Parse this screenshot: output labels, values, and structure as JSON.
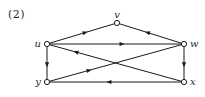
{
  "figure": {
    "label": "(2)",
    "caption": "",
    "type": "directed-graph"
  },
  "graph_data": {
    "type": "diagram",
    "directed": true,
    "nodes": [
      {
        "id": "v",
        "label": "v",
        "x": 117,
        "y": 23,
        "label_dx": 0,
        "label_dy": -5,
        "label_anchor": "middle"
      },
      {
        "id": "u",
        "label": "u",
        "x": 47,
        "y": 44,
        "label_dx": -6,
        "label_dy": 3,
        "label_anchor": "end"
      },
      {
        "id": "w",
        "label": "w",
        "x": 184,
        "y": 44,
        "label_dx": 6,
        "label_dy": 3,
        "label_anchor": "start"
      },
      {
        "id": "y",
        "label": "y",
        "x": 47,
        "y": 82,
        "label_dx": -6,
        "label_dy": 3,
        "label_anchor": "end"
      },
      {
        "id": "x",
        "label": "x",
        "x": 184,
        "y": 82,
        "label_dx": 6,
        "label_dy": 3,
        "label_anchor": "start"
      }
    ],
    "edges": [
      {
        "id": "u-v",
        "from": "u",
        "to": "v",
        "arrow_t": 0.55
      },
      {
        "id": "w-v",
        "from": "w",
        "to": "v",
        "arrow_t": 0.55
      },
      {
        "id": "u-w",
        "from": "u",
        "to": "w",
        "arrow_t": 0.55
      },
      {
        "id": "u-y",
        "from": "u",
        "to": "y",
        "arrow_t": 0.55
      },
      {
        "id": "w-x",
        "from": "w",
        "to": "x",
        "arrow_t": 0.55
      },
      {
        "id": "x-y",
        "from": "x",
        "to": "y",
        "arrow_t": 0.55
      },
      {
        "id": "x-u",
        "from": "x",
        "to": "u",
        "arrow_t": 0.8
      },
      {
        "id": "y-w",
        "from": "y",
        "to": "w",
        "arrow_t": 0.3
      }
    ],
    "node_radius": 2.6,
    "colors": {
      "stroke": "#1a1a1a",
      "node_fill": "#ffffff",
      "label": "#2b2b2b",
      "background": "#ffffff"
    }
  }
}
